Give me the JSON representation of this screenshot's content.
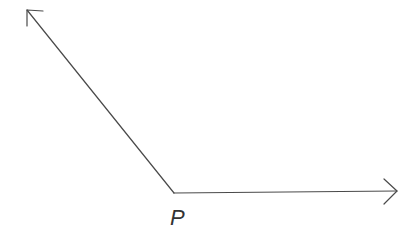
{
  "diagram": {
    "type": "angle",
    "vertex": {
      "label": "P",
      "x": 174,
      "y": 193
    },
    "rays": [
      {
        "name": "ray-upper-left",
        "from": [
          174,
          193
        ],
        "to": [
          27,
          10
        ]
      },
      {
        "name": "ray-right",
        "from": [
          174,
          193
        ],
        "to": [
          397,
          191
        ]
      }
    ],
    "colors": {
      "stroke": "#4a4a4a",
      "label": "#333333",
      "background": "#ffffff"
    }
  }
}
